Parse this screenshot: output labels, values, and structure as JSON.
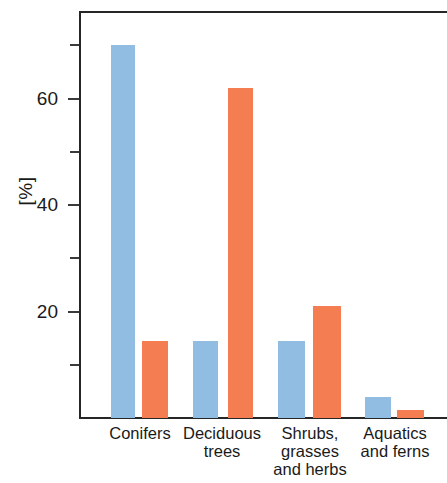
{
  "chart_data": {
    "type": "bar",
    "title": "",
    "subtitle": "",
    "xlabel": "",
    "ylabel": "[%]",
    "categories": [
      "Conifers",
      "Deciduous\ntrees",
      "Shrubs,\ngrasses\nand herbs",
      "Aquatics\nand ferns"
    ],
    "category_labels_flat": [
      "Conifers",
      "Deciduous trees",
      "Shrubs, grasses and herbs",
      "Aquatics and ferns"
    ],
    "series": [
      {
        "name": "Series 1",
        "color": "#92bde3",
        "values": [
          70,
          14.5,
          14.5,
          4
        ]
      },
      {
        "name": "Series 2",
        "color": "#f47e52",
        "values": [
          14.5,
          62,
          21,
          1.5
        ]
      }
    ],
    "ylim": [
      0,
      76.5
    ],
    "ytick_labels": [
      "20",
      "40",
      "60"
    ],
    "ytick_values": [
      20,
      40,
      60
    ],
    "yminor_values": [
      10,
      30,
      50,
      70
    ],
    "grid": false,
    "legend": "none",
    "axis_color": "#262626"
  },
  "axis": {
    "y_title": "[%]"
  }
}
